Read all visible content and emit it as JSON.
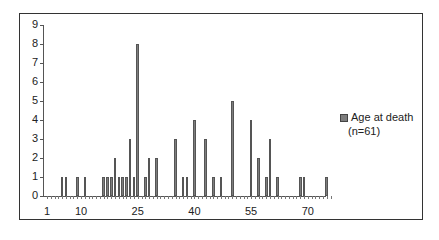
{
  "chart_data": {
    "type": "bar",
    "title": "",
    "xlabel": "",
    "ylabel": "",
    "ylim": [
      0,
      9
    ],
    "xlim": [
      1,
      76
    ],
    "grid": false,
    "legend_position": "right",
    "y_ticks": [
      "0",
      "1",
      "2",
      "3",
      "4",
      "5",
      "6",
      "7",
      "8",
      "9"
    ],
    "x_tick_labels": [
      "1",
      "10",
      "25",
      "40",
      "55",
      "70"
    ],
    "series": [
      {
        "name": "Age at death (n=61)",
        "color": "#7d7d7d",
        "x": [
          5,
          6,
          9,
          11,
          16,
          17,
          18,
          19,
          20,
          21,
          22,
          23,
          24,
          25,
          27,
          28,
          30,
          35,
          37,
          38,
          40,
          43,
          45,
          47,
          50,
          55,
          57,
          59,
          60,
          62,
          68,
          69,
          75
        ],
        "values": [
          1,
          1,
          1,
          1,
          1,
          1,
          1,
          2,
          1,
          1,
          1,
          3,
          1,
          8,
          1,
          2,
          2,
          3,
          1,
          1,
          4,
          3,
          1,
          1,
          5,
          4,
          2,
          1,
          3,
          1,
          1,
          1,
          1
        ]
      }
    ]
  },
  "legend": {
    "line1": "Age at death",
    "line2": "(n=61)"
  }
}
